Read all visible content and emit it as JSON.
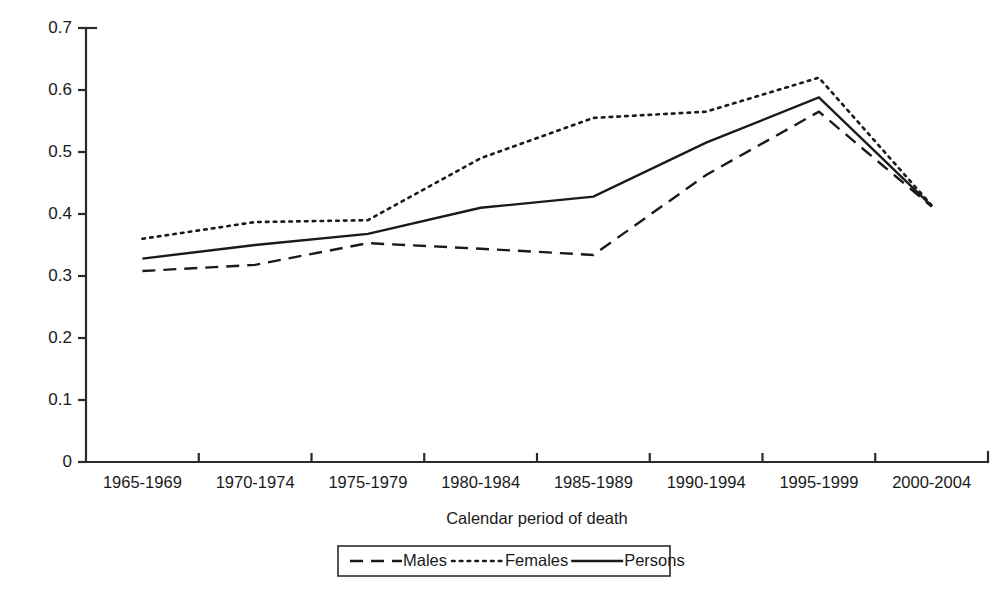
{
  "chart_data": {
    "type": "line",
    "title": "",
    "xlabel": "Calendar period of death",
    "ylabel": "",
    "categories": [
      "1965-1969",
      "1970-1974",
      "1975-1979",
      "1980-1984",
      "1985-1989",
      "1990-1994",
      "1995-1999",
      "2000-2004"
    ],
    "series": [
      {
        "name": "Males",
        "style": "dashed",
        "values": [
          0.308,
          0.318,
          0.353,
          0.344,
          0.334,
          0.463,
          0.565,
          0.412
        ]
      },
      {
        "name": "Females",
        "style": "dotted",
        "values": [
          0.36,
          0.387,
          0.39,
          0.49,
          0.555,
          0.565,
          0.62,
          0.414
        ]
      },
      {
        "name": "Persons",
        "style": "solid",
        "values": [
          0.328,
          0.35,
          0.368,
          0.41,
          0.428,
          0.515,
          0.588,
          0.413
        ]
      }
    ],
    "ylim": [
      0,
      0.7
    ],
    "yticks": [
      "0",
      "0.1",
      "0.2",
      "0.3",
      "0.4",
      "0.5",
      "0.6",
      "0.7"
    ],
    "ytick_values": [
      0,
      0.1,
      0.2,
      0.3,
      0.4,
      0.5,
      0.6,
      0.7
    ],
    "grid": false,
    "legend_position": "bottom",
    "line_color": "#1a1a1a",
    "axis_color": "#2b2b2b",
    "background": "#ffffff"
  },
  "axes": {
    "x_title": "Calendar period of death",
    "y_title": ""
  },
  "legend": {
    "entries": [
      {
        "label": "Males",
        "style": "dashed"
      },
      {
        "label": "Females",
        "style": "dotted"
      },
      {
        "label": "Persons",
        "style": "solid"
      }
    ]
  }
}
